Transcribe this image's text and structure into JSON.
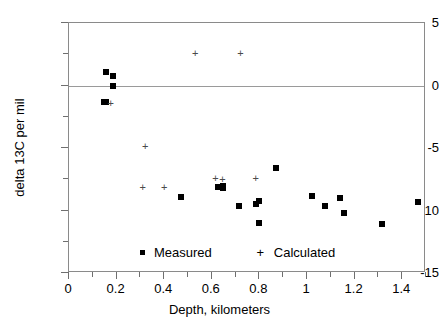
{
  "chart_data": {
    "type": "scatter",
    "title": "",
    "xlabel": "Depth,  kilometers",
    "ylabel": "delta 13C  per mil",
    "xlim": [
      0,
      1.5
    ],
    "ylim": [
      -15,
      5
    ],
    "xticks": [
      0,
      0.2,
      0.4,
      0.6,
      0.8,
      1,
      1.2,
      1.4
    ],
    "xtick_labels": [
      "0",
      "0.2",
      "0.4",
      "0.6",
      "0.8",
      "1",
      "1.2",
      "1.4"
    ],
    "yticks": [
      5,
      0,
      -5,
      -10,
      -15
    ],
    "ytick_labels": [
      "5",
      "0",
      "-5",
      "-10",
      "-15"
    ],
    "x_minor_step": 0.1,
    "y_minor_step": 2.5,
    "grid": false,
    "zero_line": true,
    "legend_position": "bottom-center",
    "series": [
      {
        "name": "Measured",
        "marker": "square",
        "color": "#000000",
        "points": [
          [
            0.155,
            1.1
          ],
          [
            0.185,
            0.8
          ],
          [
            0.185,
            0.0
          ],
          [
            0.145,
            -1.3
          ],
          [
            0.155,
            -1.3
          ],
          [
            0.47,
            -8.9
          ],
          [
            0.625,
            -8.1
          ],
          [
            0.645,
            -8.0
          ],
          [
            0.645,
            -8.2
          ],
          [
            0.715,
            -9.6
          ],
          [
            0.785,
            -9.5
          ],
          [
            0.8,
            -9.2
          ],
          [
            0.8,
            -11.0
          ],
          [
            0.87,
            -6.6
          ],
          [
            1.02,
            -8.8
          ],
          [
            1.075,
            -9.6
          ],
          [
            1.14,
            -9.0
          ],
          [
            1.155,
            -10.2
          ],
          [
            1.315,
            -11.1
          ],
          [
            1.465,
            -9.3
          ]
        ]
      },
      {
        "name": "Calculated",
        "marker": "plus",
        "color": "#4a4a4a",
        "points": [
          [
            0.175,
            -1.4
          ],
          [
            0.32,
            -4.8
          ],
          [
            0.31,
            -8.1
          ],
          [
            0.4,
            -8.1
          ],
          [
            0.615,
            -7.4
          ],
          [
            0.645,
            -7.5
          ],
          [
            0.785,
            -7.4
          ],
          [
            0.53,
            2.6
          ],
          [
            0.72,
            2.6
          ]
        ]
      }
    ]
  },
  "legend": {
    "entries": [
      {
        "label": "Measured",
        "marker": "square-marker-icon"
      },
      {
        "label": "Calculated",
        "marker": "plus-marker-icon"
      }
    ]
  }
}
